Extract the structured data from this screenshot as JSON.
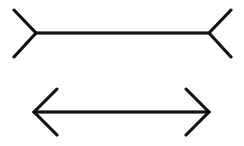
{
  "diagram": {
    "stroke_color": "#111111",
    "background": "#ffffff",
    "figures": [
      {
        "name": "fins-out-line",
        "shaft": [
          36,
          33,
          209,
          33
        ],
        "fins": [
          [
            36,
            33,
            14,
            10
          ],
          [
            36,
            33,
            14,
            57
          ],
          [
            209,
            33,
            231,
            10
          ],
          [
            209,
            33,
            231,
            57
          ]
        ]
      },
      {
        "name": "arrowheads-line",
        "shaft": [
          34,
          112,
          209,
          112
        ],
        "fins": [
          [
            34,
            112,
            57,
            89
          ],
          [
            34,
            112,
            57,
            135
          ],
          [
            209,
            112,
            186,
            89
          ],
          [
            209,
            112,
            186,
            135
          ]
        ]
      }
    ]
  }
}
